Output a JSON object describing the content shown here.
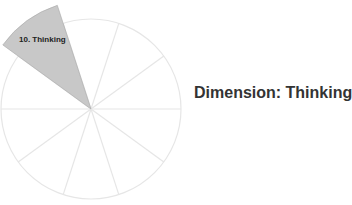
{
  "chart_data": {
    "type": "pie",
    "title": "Dimension: Thinking",
    "segments": 10,
    "highlighted": {
      "index": 10,
      "label": "10. Thinking",
      "start_angle_deg": 108,
      "end_angle_deg": 144
    },
    "colors": {
      "highlight": "#c8c8c8",
      "highlight_stroke": "#a8a8a8",
      "grid": "#e6e6e6",
      "label": "#222222",
      "title": "#333333"
    }
  },
  "wedge_label": "10. Thinking",
  "title": "Dimension: Thinking"
}
